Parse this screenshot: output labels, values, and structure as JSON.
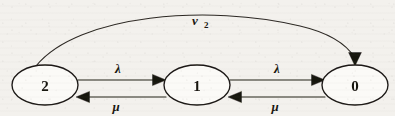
{
  "figure": {
    "background_color": "#f3f1ed",
    "ink_color": "#211e1a"
  },
  "nodes": [
    {
      "id": "node-2",
      "label": "2",
      "cx": 45,
      "cy": 85,
      "rx": 33,
      "ry": 20
    },
    {
      "id": "node-1",
      "label": "1",
      "cx": 197,
      "cy": 85,
      "rx": 33,
      "ry": 20
    },
    {
      "id": "node-0",
      "label": "0",
      "cx": 355,
      "cy": 85,
      "rx": 33,
      "ry": 20
    }
  ],
  "edges": [
    {
      "id": "edge-2-to-1",
      "from": "2",
      "to": "1",
      "label": "λ",
      "label_x": 118,
      "label_y": 73,
      "direction": "right"
    },
    {
      "id": "edge-1-to-2",
      "from": "1",
      "to": "2",
      "label": "μ",
      "label_x": 116,
      "label_y": 111,
      "direction": "left"
    },
    {
      "id": "edge-1-to-0",
      "from": "1",
      "to": "0",
      "label": "λ",
      "label_x": 277,
      "label_y": 73,
      "direction": "right"
    },
    {
      "id": "edge-0-to-1",
      "from": "0",
      "to": "1",
      "label": "μ",
      "label_x": 275,
      "label_y": 111,
      "direction": "left"
    }
  ],
  "arc": {
    "id": "arc-2-to-0",
    "from": "2",
    "to": "0",
    "label_main": "ν",
    "label_subscript": "2",
    "label_x": 197,
    "label_y": 25,
    "direction": "right"
  }
}
